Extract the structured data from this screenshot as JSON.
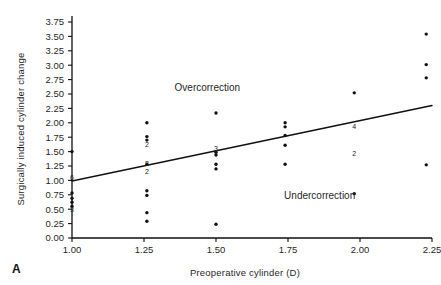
{
  "panel": {
    "letter": "A"
  },
  "chart_data": {
    "type": "scatter",
    "title": "",
    "xlabel": "Preoperative cylinder (D)",
    "ylabel": "Surgically induced cylinder change",
    "xlim": [
      1.0,
      2.25
    ],
    "ylim": [
      0.0,
      3.75
    ],
    "grid": false,
    "legend": null,
    "xticks": [
      "1.00",
      "1.25",
      "1.50",
      "1.75",
      "2.00",
      "2.25"
    ],
    "xtick_values": [
      1.0,
      1.25,
      1.5,
      1.75,
      2.0,
      2.25
    ],
    "yticks": [
      "0.00",
      "0.25",
      "0.50",
      "0.75",
      "1.00",
      "1.25",
      "1.50",
      "1.75",
      "2.00",
      "2.25",
      "2.50",
      "2.75",
      "3.00",
      "3.25",
      "3.50",
      "3.75"
    ],
    "ytick_values": [
      0.0,
      0.25,
      0.5,
      0.75,
      1.0,
      1.25,
      1.5,
      1.75,
      2.0,
      2.25,
      2.5,
      2.75,
      3.0,
      3.25,
      3.5,
      3.75
    ],
    "points": [
      {
        "x": 1.0,
        "y": 1.5
      },
      {
        "x": 1.0,
        "y": 0.78
      },
      {
        "x": 1.0,
        "y": 0.69
      },
      {
        "x": 1.0,
        "y": 0.62
      },
      {
        "x": 1.0,
        "y": 0.55
      },
      {
        "x": 1.26,
        "y": 2.0
      },
      {
        "x": 1.26,
        "y": 1.76
      },
      {
        "x": 1.26,
        "y": 1.7
      },
      {
        "x": 1.26,
        "y": 1.28
      },
      {
        "x": 1.26,
        "y": 0.82
      },
      {
        "x": 1.26,
        "y": 0.74
      },
      {
        "x": 1.26,
        "y": 0.44
      },
      {
        "x": 1.26,
        "y": 0.29
      },
      {
        "x": 1.5,
        "y": 2.17
      },
      {
        "x": 1.5,
        "y": 1.49
      },
      {
        "x": 1.5,
        "y": 1.44
      },
      {
        "x": 1.5,
        "y": 1.28
      },
      {
        "x": 1.5,
        "y": 1.2
      },
      {
        "x": 1.5,
        "y": 0.24
      },
      {
        "x": 1.74,
        "y": 2.0
      },
      {
        "x": 1.74,
        "y": 1.93
      },
      {
        "x": 1.74,
        "y": 1.78
      },
      {
        "x": 1.74,
        "y": 1.61
      },
      {
        "x": 1.74,
        "y": 1.28
      },
      {
        "x": 1.98,
        "y": 2.52
      },
      {
        "x": 1.98,
        "y": 0.77
      },
      {
        "x": 2.23,
        "y": 3.54
      },
      {
        "x": 2.23,
        "y": 3.01
      },
      {
        "x": 2.23,
        "y": 2.78
      },
      {
        "x": 2.23,
        "y": 1.27
      }
    ],
    "count_labels": [
      {
        "x": 1.0,
        "y": 1.05,
        "label": "6"
      },
      {
        "x": 1.0,
        "y": 0.49,
        "label": "3"
      },
      {
        "x": 1.26,
        "y": 1.62,
        "label": "2"
      },
      {
        "x": 1.26,
        "y": 1.3,
        "label": "8"
      },
      {
        "x": 1.26,
        "y": 1.16,
        "label": "2"
      },
      {
        "x": 1.5,
        "y": 1.56,
        "label": "3"
      },
      {
        "x": 1.98,
        "y": 1.94,
        "label": "4"
      },
      {
        "x": 1.98,
        "y": 1.47,
        "label": "2"
      }
    ],
    "fit_line": {
      "x": [
        1.0,
        2.25
      ],
      "y": [
        0.99,
        2.3
      ]
    },
    "annotations": [
      {
        "text": "Overcorrection",
        "x": 1.47,
        "y": 2.56
      },
      {
        "text": "Undercorrection",
        "x": 1.86,
        "y": 0.67
      }
    ]
  }
}
